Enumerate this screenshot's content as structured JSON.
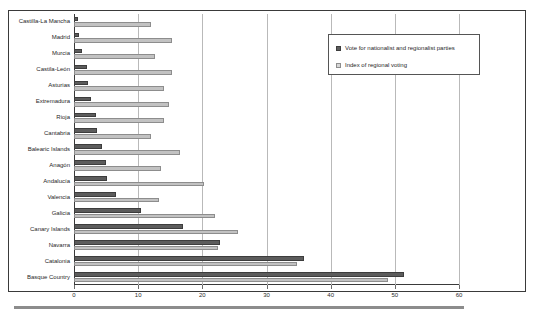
{
  "chart_data": {
    "type": "bar",
    "orientation": "horizontal",
    "title": "",
    "subtitle": "",
    "xlabel": "",
    "ylabel": "",
    "xlim": [
      0,
      60
    ],
    "xticks": [
      0,
      10,
      20,
      30,
      40,
      50,
      60
    ],
    "grid": true,
    "legend_position": "top-right",
    "categories": [
      "Castilla-La Mancha",
      "Madrid",
      "Murcia",
      "Castila-León",
      "Asturias",
      "Extremadura",
      "Rioja",
      "Cantabria",
      "Balearic Islands",
      "Anagón",
      "Andalucía",
      "Valencia",
      "Galicia",
      "Canary Islands",
      "Navarra",
      "Catalonia",
      "Basque Country"
    ],
    "series": [
      {
        "name": "Vote for nationalist and regionalist parties",
        "color": "#5c5c5c",
        "values": [
          0.6,
          0.8,
          1.2,
          2.0,
          2.2,
          2.6,
          3.5,
          3.6,
          4.3,
          5.0,
          5.2,
          6.5,
          10.5,
          17.0,
          22.8,
          35.8,
          51.5
        ]
      },
      {
        "name": "Index of regional voting",
        "color": "#c2c2c2",
        "values": [
          12.0,
          15.3,
          12.6,
          15.3,
          14.0,
          14.8,
          14.0,
          12.0,
          16.5,
          13.5,
          20.3,
          13.2,
          22.0,
          25.5,
          22.5,
          34.8,
          49.0
        ]
      }
    ]
  },
  "legend": {
    "items": [
      {
        "label": "Vote for nationalist and regionalist parties",
        "swatch": "dark"
      },
      {
        "label": "Index of regional voting",
        "swatch": "light"
      }
    ]
  },
  "axis": {
    "tick_labels": [
      "0",
      "10",
      "20",
      "30",
      "40",
      "50",
      "60"
    ]
  }
}
